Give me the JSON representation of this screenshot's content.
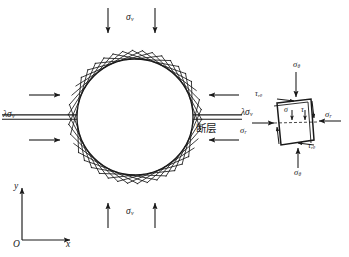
{
  "figure": {
    "background_color": "#ffffff",
    "line_color": "#1a1a1a",
    "canvas": {
      "width": 349,
      "height": 257
    }
  },
  "tunnel": {
    "center_x": 135,
    "center_y": 117,
    "radius": 58,
    "lining_hatch_count": 84,
    "lining_hatch_length": 9,
    "label_fault": "断层",
    "fault_line_half_width": 2.2
  },
  "far_field": {
    "vertical_top_label": "σ",
    "vertical_top_sub": "v",
    "vertical_bottom_label": "σ",
    "vertical_bottom_sub": "v",
    "horizontal_left_label": "λσ",
    "horizontal_left_sub": "v",
    "horizontal_right_label": "λσ",
    "horizontal_right_sub": "v",
    "top_arrow_xs": [
      108,
      155
    ],
    "bottom_arrow_xs": [
      108,
      155
    ],
    "left_arrow_ys": [
      95,
      140
    ],
    "right_arrow_ys": [
      95,
      140
    ]
  },
  "axes": {
    "origin_label": "O",
    "x_label": "x",
    "y_label": "y",
    "origin_x": 22,
    "origin_y": 240,
    "x_length": 48,
    "y_length": 52
  },
  "stress_element": {
    "sigma_theta_top": "σ",
    "sigma_theta_top_sub": "θ",
    "sigma_theta_bottom": "σ",
    "sigma_theta_bottom_sub": "θ",
    "sigma_r_left": "σ",
    "sigma_r_left_sub": "r",
    "sigma_r_right": "σ",
    "sigma_r_right_sub": "r",
    "tau_top_left": "τ",
    "tau_top_left_sub": "rθ",
    "tau_bottom_right": "τ",
    "tau_bottom_right_sub": "rθ",
    "inner_sigma": "σ",
    "inner_tau": "τ",
    "polygon_points": "277,103 311,99 314,140 281,145"
  },
  "chart_data": {
    "type": "diagram",
    "elements": [
      {
        "name": "circular-tunnel",
        "cx": 135,
        "cy": 117,
        "r": 58
      },
      {
        "name": "fault-plane",
        "y": 117,
        "from_x": 30,
        "to_x": 240
      },
      {
        "name": "vertical-load",
        "symbol": "σv",
        "direction": "compressive"
      },
      {
        "name": "horizontal-load",
        "symbol": "λσv",
        "direction": "compressive"
      },
      {
        "name": "stress-element",
        "symbols": [
          "σr",
          "σθ",
          "τrθ"
        ]
      }
    ]
  }
}
